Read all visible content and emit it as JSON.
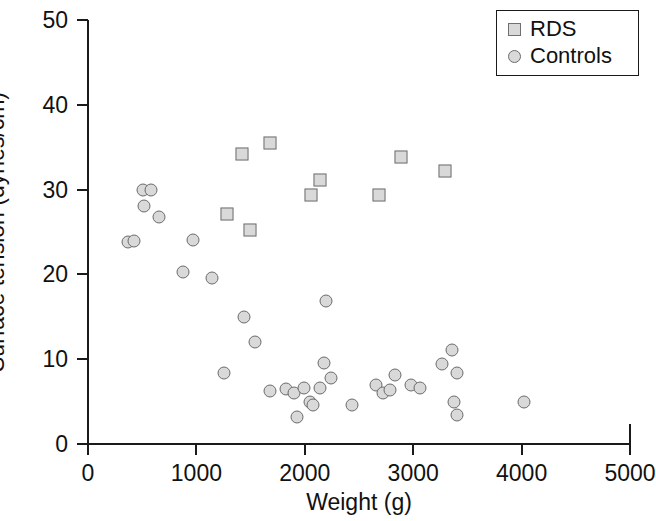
{
  "chart_data": {
    "type": "scatter",
    "title": "",
    "xlabel": "Weight (g)",
    "ylabel": "Surface tension (dynes/cm)",
    "xlim": [
      0,
      5000
    ],
    "ylim": [
      0,
      50
    ],
    "xticks": [
      0,
      1000,
      2000,
      3000,
      4000,
      5000
    ],
    "yticks": [
      0,
      10,
      20,
      30,
      40,
      50
    ],
    "xtick_labels": [
      "0",
      "1000",
      "2000",
      "3000",
      "4000",
      "5000"
    ],
    "ytick_labels": [
      "0",
      "10",
      "20",
      "30",
      "40",
      "50"
    ],
    "grid": false,
    "legend_position": "top-right",
    "series": [
      {
        "name": "RDS",
        "marker": "square",
        "color": "#d9d9d9",
        "edge_color": "#707070",
        "points": [
          [
            1280,
            27.1
          ],
          [
            1420,
            34.2
          ],
          [
            1490,
            25.2
          ],
          [
            1680,
            35.5
          ],
          [
            2060,
            29.4
          ],
          [
            2140,
            31.1
          ],
          [
            2680,
            29.4
          ],
          [
            2890,
            33.9
          ],
          [
            3290,
            32.2
          ]
        ]
      },
      {
        "name": "Controls",
        "marker": "circle",
        "color": "#d9d9d9",
        "edge_color": "#6b6b6b",
        "points": [
          [
            372,
            23.8
          ],
          [
            428,
            23.9
          ],
          [
            505,
            29.9
          ],
          [
            578,
            30.0
          ],
          [
            517,
            28.1
          ],
          [
            655,
            26.8
          ],
          [
            872,
            20.3
          ],
          [
            970,
            24.0
          ],
          [
            1140,
            19.6
          ],
          [
            1250,
            8.4
          ],
          [
            1440,
            15.0
          ],
          [
            1540,
            12.0
          ],
          [
            1680,
            6.3
          ],
          [
            1830,
            6.5
          ],
          [
            1900,
            6.0
          ],
          [
            1930,
            3.2
          ],
          [
            1990,
            6.6
          ],
          [
            2050,
            5.0
          ],
          [
            2080,
            4.6
          ],
          [
            2140,
            6.6
          ],
          [
            2180,
            9.6
          ],
          [
            2200,
            16.9
          ],
          [
            2240,
            7.8
          ],
          [
            2440,
            4.6
          ],
          [
            2660,
            7.0
          ],
          [
            2720,
            6.0
          ],
          [
            2790,
            6.4
          ],
          [
            2830,
            8.1
          ],
          [
            2980,
            7.0
          ],
          [
            3060,
            6.6
          ],
          [
            3270,
            9.4
          ],
          [
            3360,
            11.1
          ],
          [
            3400,
            8.4
          ],
          [
            3380,
            5.0
          ],
          [
            3400,
            3.4
          ],
          [
            4020,
            5.0
          ]
        ]
      }
    ]
  },
  "legend": {
    "entries": [
      {
        "label": "RDS",
        "marker": "square"
      },
      {
        "label": "Controls",
        "marker": "circle"
      }
    ]
  }
}
